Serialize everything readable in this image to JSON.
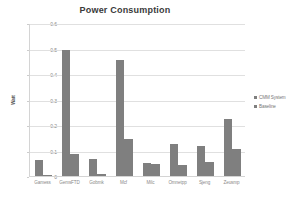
{
  "chart_data": {
    "type": "bar",
    "title": "Power Consumption",
    "xlabel": "",
    "ylabel": "Watt",
    "ylim": [
      0,
      0.6
    ],
    "ytick_labels": [
      "0",
      "0.1",
      "0.2",
      "0.3",
      "0.4",
      "0.5",
      "0.6"
    ],
    "ytick_values": [
      0,
      0.1,
      0.2,
      0.3,
      0.4,
      0.5,
      0.6
    ],
    "grid": true,
    "legend_position": "right",
    "categories": [
      "Gamess",
      "GemsFTD",
      "Gobmk",
      "Mcf",
      "Milc",
      "Omnetpp",
      "Sjeng",
      "Zeusmp"
    ],
    "series": [
      {
        "name": "CMM System",
        "color": "#7f7f7f",
        "values": [
          0.063,
          0.495,
          0.068,
          0.455,
          0.053,
          0.125,
          0.118,
          0.222
        ]
      },
      {
        "name": "Baseline",
        "color": "#7f7f7f",
        "values": [
          0.005,
          0.086,
          0.009,
          0.147,
          0.046,
          0.043,
          0.054,
          0.106
        ]
      }
    ]
  },
  "legend": {
    "entries": [
      {
        "label": "CMM System"
      },
      {
        "label": "Baseline"
      }
    ]
  }
}
